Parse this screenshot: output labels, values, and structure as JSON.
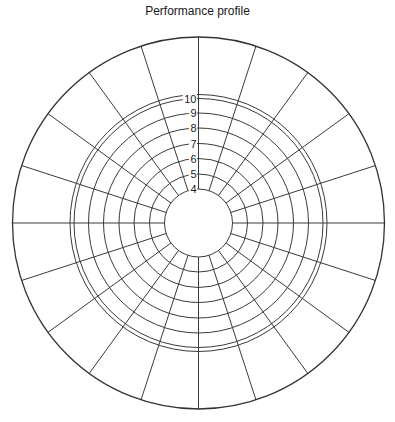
{
  "chart_data": {
    "type": "polar-grid",
    "title": "Performance profile",
    "xlabel": "",
    "ylabel": "",
    "radial_ticks": [
      4,
      5,
      6,
      7,
      8,
      9,
      10
    ],
    "radial_range": [
      4,
      10
    ],
    "extra_ring_beyond_max": true,
    "num_spokes": 20,
    "spoke_step_deg": 18,
    "grid": true,
    "legend": "none",
    "series": []
  },
  "geometry": {
    "cx": 198.5,
    "cy": 223,
    "inner_radius": 34,
    "ring_radii": [
      34,
      49,
      64.5,
      79.5,
      95,
      110,
      124.5
    ],
    "extra_ring_radius": 128.5,
    "outer_radius": 186
  },
  "colors": {
    "grid": "#3a3a3a",
    "text": "#222222",
    "background": "#ffffff"
  }
}
